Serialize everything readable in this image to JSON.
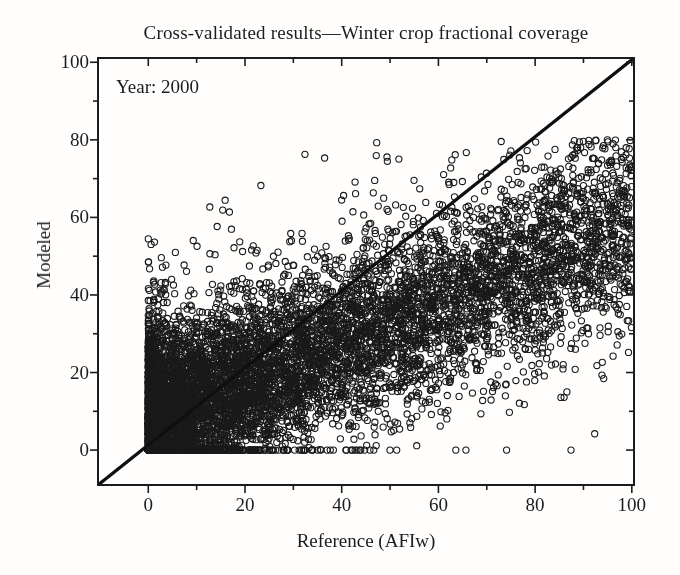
{
  "figure": {
    "background": "#fffefd",
    "ink_color": "#1c1c1c"
  },
  "chart_data": {
    "type": "scatter",
    "title": "Cross-validated results—Winter crop fractional coverage",
    "annotation": "Year: 2000",
    "xlabel": "Reference (AFIw)",
    "ylabel": "Modeled",
    "xlim": [
      -10.4,
      100.45
    ],
    "ylim": [
      -9,
      101.1
    ],
    "xticks": [
      0,
      20,
      40,
      60,
      80,
      100
    ],
    "yticks": [
      0,
      20,
      40,
      60,
      80,
      100
    ],
    "minor_tick_step": 10,
    "grid": false,
    "legend": null,
    "identity_line": {
      "description": "1:1 line drawn corner to corner of the axes box",
      "x": [
        -10.4,
        100.45
      ],
      "y": [
        -9,
        101.1
      ],
      "color": "#0f0f0f",
      "width_px": 3.4
    },
    "scatter_cloud": {
      "description": "Dense cloud of ~9000 open circles; reference and modeled winter-crop fractional coverage (0-100). Very dense near origin with sharp edges at x=0 and y=0, fanning to roughly y 25-78 at x=100; slight overestimation at low reference, underestimation at high reference.",
      "n_points": 9000,
      "seed": 77,
      "x_model": {
        "formula": "x = 100 * u^power, u~U(0,1)",
        "power": 2.3,
        "clip": [
          0,
          100
        ]
      },
      "y_model": {
        "formula": "y = intercept + slope*x + gaussian noise (two-component), soft ceiling 80, clipped 0-100",
        "intercept": 6.5,
        "slope": 0.52,
        "sd_base": 10.5,
        "sd_slope": 0.02,
        "tail_sd_base": 19,
        "tail_sd_slope": 0.03,
        "tail_weight_base": 0.17,
        "tail_weight_slope": -0.0012,
        "tail_weight_min": 0.04,
        "soft_ceiling": 80,
        "clip": [
          0,
          100
        ]
      },
      "marker": "open-circle",
      "marker_radius_px": 3.1,
      "marker_stroke_px": 1.1,
      "color": "#1a1a1a"
    },
    "axis_style": {
      "box": true,
      "major_tick_len_px": 8,
      "minor_tick_len_px": 5,
      "ticks_left_bottom": "outward",
      "ticks_top_right": "inward"
    }
  }
}
